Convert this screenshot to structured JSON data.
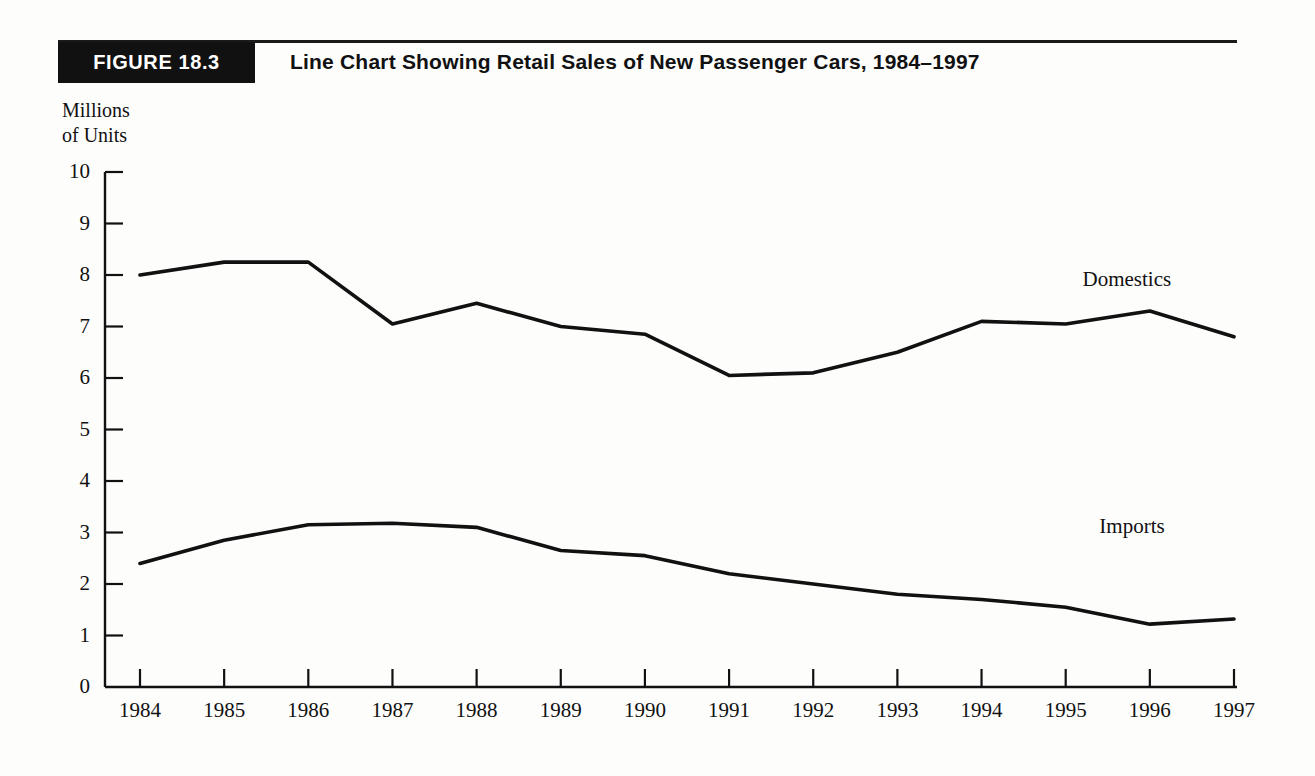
{
  "header": {
    "badge_label": "FIGURE 18.3",
    "title": "Line Chart Showing Retail Sales of New Passenger Cars, 1984–1997"
  },
  "chart_data": {
    "type": "line",
    "title": "Line Chart Showing Retail Sales of New Passenger Cars, 1984–1997",
    "xlabel": "",
    "ylabel": "Millions\nof Units",
    "x": [
      1984,
      1985,
      1986,
      1987,
      1988,
      1989,
      1990,
      1991,
      1992,
      1993,
      1994,
      1995,
      1996,
      1997
    ],
    "xtick_labels": [
      "1984",
      "1985",
      "1986",
      "1987",
      "1988",
      "1989",
      "1990",
      "1991",
      "1992",
      "1993",
      "1994",
      "1995",
      "1996",
      "1997"
    ],
    "ytick_labels": [
      "0",
      "1",
      "2",
      "3",
      "4",
      "5",
      "6",
      "7",
      "8",
      "9",
      "10"
    ],
    "ytick_values": [
      0,
      1,
      2,
      3,
      4,
      5,
      6,
      7,
      8,
      9,
      10
    ],
    "ylim": [
      0,
      10
    ],
    "grid": false,
    "legend_position": "inline-annotation",
    "series": [
      {
        "name": "Domestics",
        "label_text": "Domestics",
        "color": "#111111",
        "values": [
          8.0,
          8.25,
          8.25,
          7.05,
          7.45,
          7.0,
          6.85,
          6.05,
          6.1,
          6.5,
          7.1,
          7.05,
          7.3,
          6.8
        ]
      },
      {
        "name": "Imports",
        "label_text": "Imports",
        "color": "#111111",
        "values": [
          2.4,
          2.85,
          3.15,
          3.18,
          3.1,
          2.65,
          2.55,
          2.2,
          2.0,
          1.8,
          1.7,
          1.55,
          1.22,
          1.32
        ]
      }
    ],
    "annotations": [
      {
        "text": "Domestics",
        "x": 1995.2,
        "y": 7.9
      },
      {
        "text": "Imports",
        "x": 1995.4,
        "y": 3.1
      }
    ]
  },
  "colors": {
    "ink": "#111111",
    "page": "#fdfdfc",
    "badge_bg": "#111111",
    "badge_fg": "#ffffff"
  }
}
